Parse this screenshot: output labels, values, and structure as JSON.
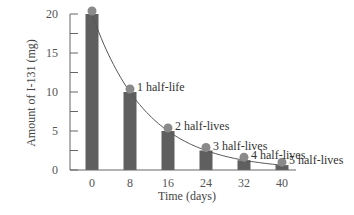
{
  "chart_data": {
    "type": "bar",
    "title": "",
    "xlabel": "Time (days)",
    "ylabel": "Amount of I-131 (mg)",
    "categories": [
      "0",
      "8",
      "16",
      "24",
      "32",
      "40"
    ],
    "x": [
      0,
      8,
      16,
      24,
      32,
      40
    ],
    "values": [
      20,
      10,
      5,
      2.5,
      1.25,
      0.625
    ],
    "series": [
      {
        "name": "Amount of I-131 (mg)",
        "type": "bar",
        "values": [
          20,
          10,
          5,
          2.5,
          1.25,
          0.625
        ]
      },
      {
        "name": "Decay curve",
        "type": "line",
        "values": [
          20,
          10,
          5,
          2.5,
          1.25,
          0.625
        ]
      }
    ],
    "annotations": [
      {
        "x": 8,
        "text": "1 half-life"
      },
      {
        "x": 16,
        "text": "2 half-lives"
      },
      {
        "x": 24,
        "text": "3 half-lives"
      },
      {
        "x": 32,
        "text": "4 half-lives"
      },
      {
        "x": 40,
        "text": "5 half-lives"
      }
    ],
    "yticks": [
      0,
      5,
      10,
      15,
      20
    ],
    "ylim": [
      0,
      20
    ],
    "xlim": [
      0,
      40
    ],
    "grid": false,
    "legend": "none",
    "colors": {
      "bar": "#5f5f5f",
      "marker": "#8a8a8a",
      "curve": "#555555",
      "axis": "#666666"
    }
  }
}
